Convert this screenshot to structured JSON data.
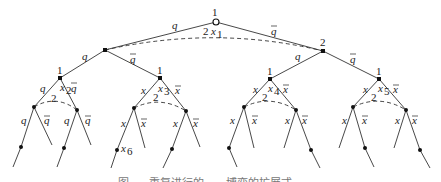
{
  "figure": {
    "caption": "图 x-x  重复进行的……博弈的扩展式",
    "root": {
      "player": "1",
      "info_label_player": "2",
      "info_label_set": "x",
      "info_label_sub": "1"
    },
    "level1": {
      "left_edge": {
        "label": "q",
        "bar": false
      },
      "right_edge": {
        "label": "q",
        "bar": true
      },
      "right_node_player": "2"
    },
    "level2": [
      {
        "player": "1",
        "edge_label": "q",
        "edge_bar": false
      },
      {
        "player": "1",
        "edge_label": "q",
        "edge_bar": true
      },
      {
        "player": "1",
        "edge_label": "q",
        "edge_bar": false
      },
      {
        "player": "1",
        "edge_label": "q",
        "edge_bar": true
      }
    ],
    "level2_nodes": [
      {
        "player": "1",
        "set": "x",
        "sub": "2",
        "left": "q",
        "right": "q",
        "info_player": "2"
      },
      {
        "player": "1",
        "set": "x",
        "sub": "3",
        "left": "x",
        "right": "x",
        "info_player": "2"
      },
      {
        "player": "1",
        "set": "x",
        "sub": "4",
        "left": "x",
        "right": "x",
        "info_player": "2"
      },
      {
        "player": "1",
        "set": "x",
        "sub": "5",
        "left": "x",
        "right": "x",
        "info_player": "2"
      }
    ],
    "leaf_label": {
      "set": "x",
      "sub": "6"
    }
  }
}
